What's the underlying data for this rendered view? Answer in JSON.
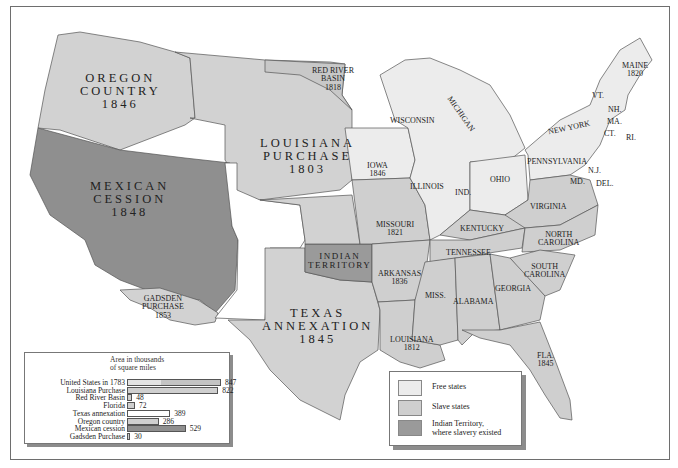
{
  "colors": {
    "free_state": "#ececec",
    "slave_state": "#cfcfcf",
    "indian_territory": "#9a9a9a",
    "mexican_cession": "#8f8f8f",
    "territory_gray": "#d8d8d8",
    "unorganized_white": "#ffffff",
    "border": "#555555"
  },
  "regions": {
    "oregon": {
      "name": "OREGON",
      "line2": "COUNTRY",
      "year": "1846"
    },
    "louisiana": {
      "name": "LOUISIANA",
      "line2": "PURCHASE",
      "year": "1803"
    },
    "mexican": {
      "name": "MEXICAN",
      "line2": "CESSION",
      "year": "1848"
    },
    "texas": {
      "name": "TEXAS",
      "line2": "ANNEXATION",
      "year": "1845"
    },
    "red_river": {
      "name": "RED RIVER",
      "line2": "BASIN",
      "year": "1818"
    },
    "gadsden": {
      "name": "GADSDEN",
      "line2": "PURCHASE",
      "year": "1853"
    },
    "indian": {
      "name": "INDIAN",
      "line2": "TERRITORY"
    }
  },
  "states": {
    "maine": {
      "name": "MAINE",
      "year": "1820"
    },
    "vt": "VT.",
    "nh": "NH.",
    "ma": "MA.",
    "ct": "CT.",
    "ri": "RI.",
    "ny": "NEW YORK",
    "pa": "PENNSYLVANIA",
    "nj": "N.J.",
    "de": "DEL.",
    "md": "MD.",
    "ohio": "OHIO",
    "ind": "IND.",
    "illinois": "ILLINOIS",
    "michigan": "MICHIGAN",
    "wisconsin": "WISCONSIN",
    "iowa": {
      "name": "IOWA",
      "year": "1846"
    },
    "missouri": {
      "name": "MISSOURI",
      "year": "1821"
    },
    "arkansas": {
      "name": "ARKANSAS",
      "year": "1836"
    },
    "louisiana": {
      "name": "LOUISIANA",
      "year": "1812"
    },
    "virginia": "VIRGINIA",
    "kentucky": "KENTUCKY",
    "tennessee": "TENNESSEE",
    "nc": {
      "name": "NORTH",
      "line2": "CAROLINA"
    },
    "sc": {
      "name": "SOUTH",
      "line2": "CAROLINA"
    },
    "georgia": "GEORGIA",
    "alabama": "ALABAMA",
    "miss": "MISS.",
    "fla": {
      "name": "FLA.",
      "year": "1845"
    }
  },
  "chart_data": {
    "type": "bar",
    "title_line1": "Area in thousands",
    "title_line2": "of square miles",
    "orientation": "horizontal",
    "categories": [
      "United States in 1783",
      "Louisiana Purchase",
      "Red River Basin",
      "Florida",
      "Texas annexation",
      "Oregon country",
      "Mexican cession",
      "Gadsden Purchase"
    ],
    "values": [
      847,
      822,
      48,
      72,
      389,
      286,
      529,
      30
    ],
    "value_labels": [
      "847",
      "822",
      "48",
      "72",
      "389",
      "286",
      "529",
      "30"
    ],
    "xlabel": "",
    "ylabel": "",
    "grid": false
  },
  "legend": {
    "items": [
      {
        "label": "Free states"
      },
      {
        "label": "Slave states"
      },
      {
        "label": "Indian Territory,",
        "label2": "where slavery existed"
      }
    ]
  }
}
